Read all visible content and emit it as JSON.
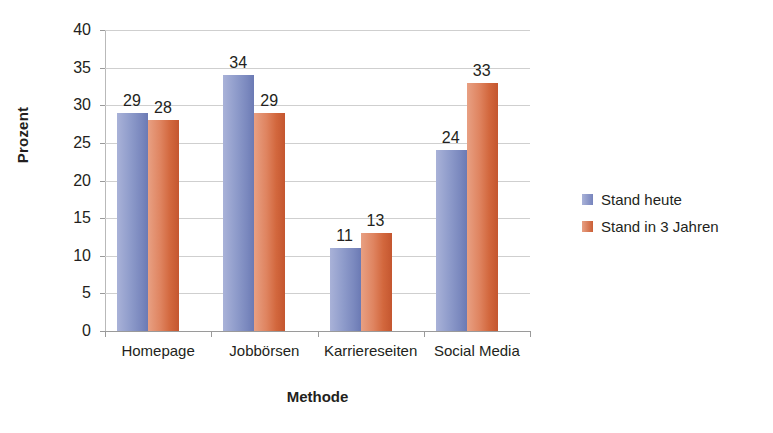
{
  "chart_data": {
    "type": "bar",
    "title": "",
    "xlabel": "Methode",
    "ylabel": "Prozent",
    "categories": [
      "Homepage",
      "Jobbörsen",
      "Karriereseiten",
      "Social Media"
    ],
    "series": [
      {
        "name": "Stand heute",
        "color": "#8f9ccb",
        "values": [
          29,
          34,
          11,
          24
        ]
      },
      {
        "name": "Stand in 3 Jahren",
        "color": "#d97a56",
        "values": [
          28,
          29,
          13,
          33
        ]
      }
    ],
    "ylim": [
      0,
      40
    ],
    "ytick_step": 5,
    "yticks": [
      40,
      35,
      30,
      25,
      20,
      15,
      10,
      5,
      0
    ],
    "grid": true,
    "legend_position": "right",
    "axis_color": "#9a9a9a",
    "gridline_color": "#cfcfcf",
    "background": "#ffffff"
  },
  "legend": {
    "items": [
      {
        "label": "Stand heute"
      },
      {
        "label": "Stand in 3 Jahren"
      }
    ]
  }
}
